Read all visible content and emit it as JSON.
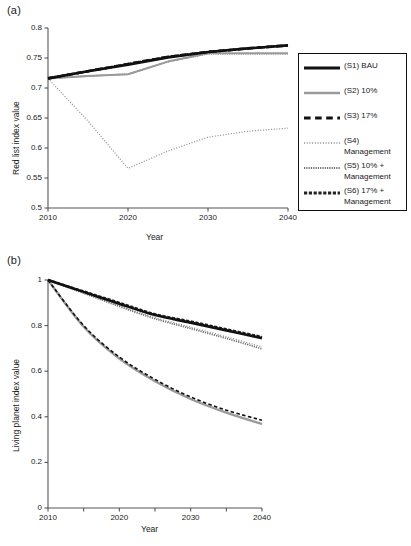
{
  "figure": {
    "panels": [
      {
        "tag": "(a)",
        "xlabel": "Year",
        "ylabel": "Red list index value"
      },
      {
        "tag": "(b)",
        "xlabel": "Year",
        "ylabel": "Living planet index value"
      }
    ],
    "caption_fragment": ""
  },
  "colors": {
    "black": "#111111",
    "gray": "#9a9a9a",
    "axis": "#555555",
    "background": "#ffffff"
  },
  "chart_data": [
    {
      "type": "line",
      "panel": "(a)",
      "title": "",
      "xlabel": "Year",
      "ylabel": "Red list index value",
      "xlim": [
        2010,
        2040
      ],
      "ylim": [
        0.5,
        0.8
      ],
      "xticks": [
        2010,
        2020,
        2030,
        2040
      ],
      "xticklabels": [
        "2010",
        "2020",
        "2030",
        "2040"
      ],
      "yticks": [
        0.5,
        0.55,
        0.6,
        0.65,
        0.7,
        0.75,
        0.8
      ],
      "yticklabels": [
        "0.5",
        "0.55",
        "0.6",
        "0.65",
        "0.7",
        "0.75",
        "0.8"
      ],
      "grid": false,
      "legend_position": "right-outside",
      "x": [
        2010,
        2015,
        2020,
        2025,
        2030,
        2035,
        2040
      ],
      "series": [
        {
          "name": "(S1) BAU",
          "style": "solid",
          "color": "#111111",
          "width": 2.6,
          "values": [
            0.716,
            0.728,
            0.739,
            0.751,
            0.76,
            0.766,
            0.771
          ]
        },
        {
          "name": "(S2) 10%",
          "style": "solid",
          "color": "#9a9a9a",
          "width": 2.0,
          "values": [
            0.716,
            0.72,
            0.723,
            0.744,
            0.758,
            0.758,
            0.758
          ]
        },
        {
          "name": "(S3) 17%",
          "style": "dashed",
          "color": "#111111",
          "width": 2.6,
          "values": [
            0.716,
            0.728,
            0.74,
            0.752,
            0.76,
            0.766,
            0.771
          ]
        },
        {
          "name": "(S4) Management",
          "style": "dotted",
          "color": "#8a8a8a",
          "width": 1.2,
          "values": [
            0.716,
            0.645,
            0.566,
            0.595,
            0.618,
            0.628,
            0.633
          ]
        },
        {
          "name": "(S5) 10% + Management",
          "style": "fine-dotted",
          "color": "#6f6f6f",
          "width": 1.6,
          "values": [
            0.716,
            0.72,
            0.723,
            0.744,
            0.757,
            0.757,
            0.757
          ]
        },
        {
          "name": "(S6) 17% + Management",
          "style": "dash-dense",
          "color": "#222222",
          "width": 2.4,
          "values": [
            0.716,
            0.728,
            0.74,
            0.752,
            0.76,
            0.766,
            0.771
          ]
        }
      ]
    },
    {
      "type": "line",
      "panel": "(b)",
      "title": "",
      "xlabel": "Year",
      "ylabel": "Living planet index value",
      "xlim": [
        2010,
        2040
      ],
      "ylim": [
        0,
        1
      ],
      "xticks": [
        2010,
        2015,
        2020,
        2025,
        2030,
        2035,
        2040
      ],
      "xticklabels": [
        "2010",
        "",
        "2020",
        "",
        "2030",
        "",
        "2040"
      ],
      "yticks": [
        0,
        0.2,
        0.4,
        0.6,
        0.8,
        1
      ],
      "yticklabels": [
        "0",
        "0.2",
        "0.4",
        "0.6",
        "0.8",
        "1"
      ],
      "grid": false,
      "legend_position": "right-outside",
      "x": [
        2010,
        2015,
        2020,
        2025,
        2030,
        2035,
        2040
      ],
      "series": [
        {
          "name": "(S1) BAU",
          "style": "solid",
          "color": "#111111",
          "width": 2.6,
          "values": [
            1.0,
            0.948,
            0.896,
            0.846,
            0.813,
            0.779,
            0.745
          ]
        },
        {
          "name": "(S2) 10%",
          "style": "solid",
          "color": "#9a9a9a",
          "width": 2.4,
          "values": [
            1.0,
            0.795,
            0.655,
            0.556,
            0.478,
            0.418,
            0.368
          ]
        },
        {
          "name": "(S3) 17%",
          "style": "dashed",
          "color": "#111111",
          "width": 1.6,
          "values": [
            1.0,
            0.8,
            0.662,
            0.564,
            0.487,
            0.429,
            0.385
          ]
        },
        {
          "name": "(S4) Increased Management",
          "style": "dotted",
          "color": "#8a8a8a",
          "width": 1.3,
          "values": [
            1.0,
            0.944,
            0.888,
            0.835,
            0.793,
            0.751,
            0.707
          ]
        },
        {
          "name": "(S5) 10% + Increased Management",
          "style": "fine-dotted",
          "color": "#6f6f6f",
          "width": 1.7,
          "values": [
            1.0,
            0.942,
            0.884,
            0.83,
            0.787,
            0.744,
            0.698
          ]
        },
        {
          "name": "(S6) 17% + Increased Management",
          "style": "dash-dense",
          "color": "#222222",
          "width": 2.4,
          "values": [
            1.0,
            0.95,
            0.9,
            0.85,
            0.818,
            0.784,
            0.75
          ]
        }
      ]
    }
  ],
  "legend_a": {
    "items": [
      {
        "label": "(S1) BAU",
        "style": "solid",
        "color": "#111111",
        "width": 3.0
      },
      {
        "label": "(S2) 10%",
        "style": "solid",
        "color": "#9a9a9a",
        "width": 2.6
      },
      {
        "label": "(S3) 17%",
        "style": "dashed",
        "color": "#111111",
        "width": 3.0
      },
      {
        "label": "(S4)\nManagement",
        "style": "dotted",
        "color": "#8a8a8a",
        "width": 1.6
      },
      {
        "label": "(S5) 10% +\nManagement",
        "style": "fine-dotted",
        "color": "#6f6f6f",
        "width": 2.0
      },
      {
        "label": "(S6) 17% +\nManagement",
        "style": "dash-dense",
        "color": "#222222",
        "width": 2.8
      }
    ]
  },
  "legend_b": {
    "items": [
      {
        "label": "(S1) BAU",
        "style": "solid",
        "color": "#111111",
        "width": 3.0
      },
      {
        "label": "(S2) 10%",
        "style": "solid",
        "color": "#9a9a9a",
        "width": 2.8
      },
      {
        "label": "(S3) 17%",
        "style": "dashed",
        "color": "#111111",
        "width": 2.0
      },
      {
        "label": "(S4) Increased\nManagement",
        "style": "dotted",
        "color": "#8a8a8a",
        "width": 1.6
      },
      {
        "label": "(S5) 10% +\nIncreased\nManagement",
        "style": "fine-dotted",
        "color": "#6f6f6f",
        "width": 2.0
      },
      {
        "label": "(S6) 17% +\nIncreased\nManagement",
        "style": "dash-dense",
        "color": "#222222",
        "width": 2.8
      }
    ]
  }
}
